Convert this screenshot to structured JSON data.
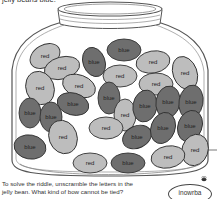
{
  "header": {
    "partial_text": "jelly beans blue."
  },
  "colors": {
    "red": "#bdbdbd",
    "blue": "#6e6e6e",
    "outline": "#333333",
    "jar": "#555555"
  },
  "beans": [
    {
      "label": "red",
      "cx": 45,
      "cy": 56,
      "rx": 16,
      "ry": 11,
      "rot": -30
    },
    {
      "label": "blue",
      "cx": 94,
      "cy": 62,
      "rx": 11,
      "ry": 15,
      "rot": -20
    },
    {
      "label": "blue",
      "cx": 124,
      "cy": 50,
      "rx": 17,
      "ry": 11,
      "rot": 0
    },
    {
      "label": "red",
      "cx": 153,
      "cy": 62,
      "rx": 17,
      "ry": 11,
      "rot": -10
    },
    {
      "label": "red",
      "cx": 62,
      "cy": 68,
      "rx": 18,
      "ry": 11,
      "rot": -15
    },
    {
      "label": "red",
      "cx": 120,
      "cy": 76,
      "rx": 17,
      "ry": 11,
      "rot": 0
    },
    {
      "label": "red",
      "cx": 156,
      "cy": 84,
      "rx": 17,
      "ry": 11,
      "rot": 0
    },
    {
      "label": "red",
      "cx": 185,
      "cy": 73,
      "rx": 12,
      "ry": 17,
      "rot": -20
    },
    {
      "label": "red",
      "cx": 40,
      "cy": 88,
      "rx": 14,
      "ry": 17,
      "rot": -20
    },
    {
      "label": "red",
      "cx": 79,
      "cy": 86,
      "rx": 17,
      "ry": 11,
      "rot": 20
    },
    {
      "label": "blue",
      "cx": 30,
      "cy": 113,
      "rx": 11,
      "ry": 15,
      "rot": 0
    },
    {
      "label": "blue",
      "cx": 51,
      "cy": 117,
      "rx": 11,
      "ry": 15,
      "rot": 0
    },
    {
      "label": "blue",
      "cx": 73,
      "cy": 104,
      "rx": 16,
      "ry": 11,
      "rot": 15
    },
    {
      "label": "blue",
      "cx": 109,
      "cy": 98,
      "rx": 11,
      "ry": 16,
      "rot": 0
    },
    {
      "label": "red",
      "cx": 125,
      "cy": 115,
      "rx": 11,
      "ry": 16,
      "rot": 0
    },
    {
      "label": "blue",
      "cx": 145,
      "cy": 106,
      "rx": 12,
      "ry": 16,
      "rot": 10
    },
    {
      "label": "blue",
      "cx": 168,
      "cy": 102,
      "rx": 12,
      "ry": 16,
      "rot": 10
    },
    {
      "label": "blue",
      "cx": 191,
      "cy": 102,
      "rx": 12,
      "ry": 17,
      "rot": 10
    },
    {
      "label": "blue",
      "cx": 30,
      "cy": 147,
      "rx": 16,
      "ry": 12,
      "rot": 10
    },
    {
      "label": "red",
      "cx": 63,
      "cy": 137,
      "rx": 14,
      "ry": 17,
      "rot": -20
    },
    {
      "label": "red",
      "cx": 106,
      "cy": 128,
      "rx": 17,
      "ry": 11,
      "rot": 0
    },
    {
      "label": "blue",
      "cx": 137,
      "cy": 137,
      "rx": 15,
      "ry": 11,
      "rot": -25
    },
    {
      "label": "blue",
      "cx": 163,
      "cy": 128,
      "rx": 12,
      "ry": 16,
      "rot": 20
    },
    {
      "label": "blue",
      "cx": 190,
      "cy": 126,
      "rx": 12,
      "ry": 16,
      "rot": 20
    },
    {
      "label": "red",
      "cx": 195,
      "cy": 150,
      "rx": 13,
      "ry": 16,
      "rot": 20
    },
    {
      "label": "red",
      "cx": 90,
      "cy": 163,
      "rx": 17,
      "ry": 10,
      "rot": 0
    },
    {
      "label": "blue",
      "cx": 128,
      "cy": 163,
      "rx": 17,
      "ry": 10,
      "rot": 0
    },
    {
      "label": "red",
      "cx": 168,
      "cy": 157,
      "rx": 17,
      "ry": 11,
      "rot": -10
    }
  ],
  "riddle": {
    "line1": "To solve the riddle, unscramble the letters in the",
    "line2": "jelly bean. What kind of bow cannot be tied?"
  },
  "answer_bean": {
    "text": "inowrba"
  }
}
